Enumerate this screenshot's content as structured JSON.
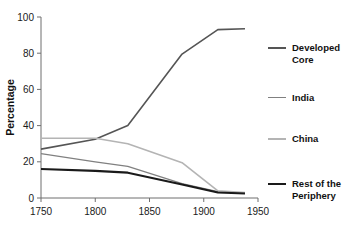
{
  "chart_data": {
    "type": "line",
    "title": "",
    "subtitle": "",
    "xlabel": "",
    "ylabel": "Percentage",
    "xlim": [
      1750,
      1950
    ],
    "ylim": [
      0,
      100
    ],
    "xticks": [
      1750,
      1800,
      1850,
      1900,
      1950
    ],
    "yticks": [
      0,
      20,
      40,
      60,
      80,
      100
    ],
    "xtick_labels": [
      "1750",
      "1800",
      "1850",
      "1900",
      "1950"
    ],
    "ytick_labels": [
      "0",
      "20",
      "40",
      "60",
      "80",
      "100"
    ],
    "grid": false,
    "legend_position": "right",
    "series": [
      {
        "name": "Developed Core",
        "label": "Developed\nCore",
        "color": "#555555",
        "width": 1.6,
        "x": [
          1750,
          1800,
          1830,
          1880,
          1913,
          1938
        ],
        "values": [
          27,
          32.5,
          40,
          79.5,
          93,
          93.5
        ]
      },
      {
        "name": "India",
        "label": "India",
        "color": "#808080",
        "width": 1.3,
        "x": [
          1750,
          1800,
          1830,
          1880,
          1913,
          1938
        ],
        "values": [
          24.5,
          20,
          17.5,
          8,
          3.5,
          2.5
        ]
      },
      {
        "name": "China",
        "label": "China",
        "color": "#b4b4b4",
        "width": 1.6,
        "x": [
          1750,
          1800,
          1830,
          1880,
          1913,
          1938
        ],
        "values": [
          33,
          33,
          30,
          19.5,
          4,
          3
        ]
      },
      {
        "name": "Rest of the Periphery",
        "label": "Rest of the\nPeriphery",
        "color": "#1a1a1a",
        "width": 2.1,
        "x": [
          1750,
          1800,
          1830,
          1880,
          1913,
          1938
        ],
        "values": [
          16,
          15,
          14,
          7.5,
          3,
          2.5
        ]
      }
    ]
  },
  "legend": {
    "items": [
      {
        "label": "Developed\nCore",
        "color": "#555555",
        "width": 1.8,
        "top": 42
      },
      {
        "label": "India",
        "color": "#808080",
        "width": 1.4,
        "top": 92
      },
      {
        "label": "China",
        "color": "#b4b4b4",
        "width": 1.8,
        "top": 133
      },
      {
        "label": "Rest of the\nPeriphery",
        "color": "#1a1a1a",
        "width": 2.4,
        "top": 178
      }
    ]
  }
}
